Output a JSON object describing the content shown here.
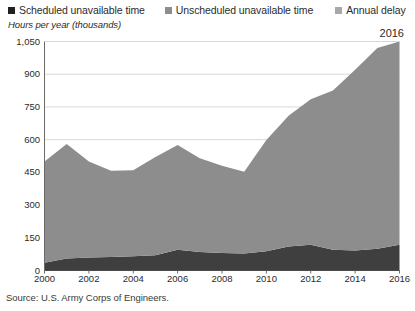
{
  "legend": {
    "items": [
      {
        "label": "Scheduled unavailable time",
        "color": "#231f20",
        "icon": "legend-square-icon"
      },
      {
        "label": "Unscheduled unavailable time",
        "color": "#8d8d8d",
        "icon": "legend-square-icon"
      },
      {
        "label": "Annual delay",
        "color": "#a8a8a8",
        "icon": "legend-square-icon"
      }
    ]
  },
  "axis_title": "Hours per year (thousands)",
  "year_callout": "2016",
  "source": "Source: U.S. Army Corps of Engineers.",
  "colors": {
    "scheduled": "#3f3f3f",
    "unscheduled": "#8d8d8d",
    "annual_delay": "#a8a8a8",
    "gridline": "#d9d9d9",
    "axis": "#6b6b6b",
    "text": "#2b2b2b",
    "background": "#ffffff"
  },
  "chart_data": {
    "type": "area",
    "title": "",
    "subtitle": "",
    "xlabel": "",
    "ylabel": "Hours per year (thousands)",
    "stacked": true,
    "grid": true,
    "legend_position": "top",
    "xlim": [
      2000,
      2016
    ],
    "ylim": [
      0,
      1050
    ],
    "yticks": [
      0,
      150,
      300,
      450,
      600,
      750,
      900,
      1050
    ],
    "ytick_labels": [
      "0",
      "150",
      "300",
      "450",
      "600",
      "750",
      "900",
      "1,050"
    ],
    "xticks": [
      2000,
      2002,
      2004,
      2006,
      2008,
      2010,
      2012,
      2014,
      2016
    ],
    "xtick_labels": [
      "2000",
      "2002",
      "2004",
      "2006",
      "2008",
      "2010",
      "2012",
      "2014",
      "2016"
    ],
    "x": [
      2000,
      2001,
      2002,
      2003,
      2004,
      2005,
      2006,
      2007,
      2008,
      2009,
      2010,
      2011,
      2012,
      2013,
      2014,
      2015,
      2016
    ],
    "annotations": [
      {
        "text": "2016",
        "x": 2016,
        "position": "top-right"
      }
    ],
    "series": [
      {
        "name": "Scheduled unavailable time",
        "color": "#3f3f3f",
        "values": [
          35,
          55,
          60,
          62,
          65,
          70,
          95,
          85,
          80,
          78,
          88,
          110,
          118,
          95,
          92,
          100,
          118
        ]
      },
      {
        "name": "Unscheduled unavailable time",
        "color": "#8d8d8d",
        "values": [
          465,
          525,
          440,
          395,
          395,
          450,
          480,
          430,
          400,
          375,
          510,
          600,
          667,
          730,
          828,
          920,
          932
        ]
      },
      {
        "name": "Annual delay",
        "color": "#a8a8a8",
        "values": [
          0,
          0,
          0,
          0,
          0,
          0,
          0,
          0,
          0,
          0,
          0,
          0,
          0,
          0,
          0,
          0,
          0
        ]
      }
    ],
    "totals": [
      500,
      580,
      500,
      457,
      460,
      520,
      575,
      515,
      480,
      453,
      598,
      710,
      785,
      825,
      920,
      1020,
      1050
    ]
  }
}
